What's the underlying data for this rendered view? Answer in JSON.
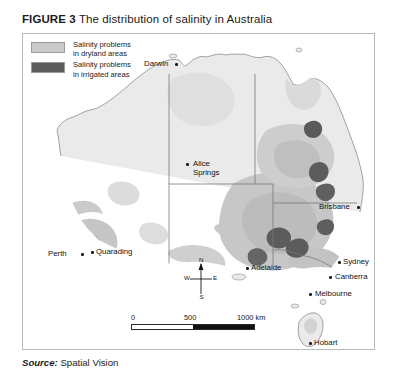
{
  "figure": {
    "label": "FIGURE 3",
    "title": "The distribution of salinity in Australia"
  },
  "legend": {
    "items": [
      {
        "swatch_color": "#c9c9c9",
        "line1": "Salinity problems",
        "line2": "in dryland areas"
      },
      {
        "swatch_color": "#5c5c5c",
        "line1": "Salinity problems",
        "line2": "in irrigated areas"
      }
    ]
  },
  "map": {
    "cities": [
      {
        "name": "Darwin",
        "label_x": 121,
        "label_y": 25,
        "dot_x": 152,
        "dot_y": 29
      },
      {
        "name": "Alice Springs",
        "label_x": 170,
        "label_y": 125,
        "dot_x": 163,
        "dot_y": 129,
        "two_line": true
      },
      {
        "name": "Brisbane",
        "label_x": 296,
        "label_y": 168,
        "dot_x": 334,
        "dot_y": 172
      },
      {
        "name": "Sydney",
        "label_x": 320,
        "label_y": 223,
        "dot_x": 315,
        "dot_y": 227
      },
      {
        "name": "Canberra",
        "label_x": 312,
        "label_y": 238,
        "dot_x": 306,
        "dot_y": 242
      },
      {
        "name": "Melbourne",
        "label_x": 292,
        "label_y": 255,
        "dot_x": 286,
        "dot_y": 259
      },
      {
        "name": "Adelaide",
        "label_x": 228,
        "label_y": 229,
        "dot_x": 223,
        "dot_y": 233
      },
      {
        "name": "Perth",
        "label_x": 25,
        "label_y": 215,
        "dot_x": 58,
        "dot_y": 219
      },
      {
        "name": "Quarading",
        "label_x": 73,
        "label_y": 213,
        "dot_x": 68,
        "dot_y": 217
      },
      {
        "name": "Hobart",
        "label_x": 291,
        "label_y": 304,
        "dot_x": 286,
        "dot_y": 308
      }
    ],
    "compass": {
      "north": "N",
      "south": "S",
      "east": "E",
      "west": "W"
    },
    "scalebar": {
      "tick_0": "0",
      "tick_500": "500",
      "tick_1000": "1000 km"
    },
    "colors": {
      "ocean": "#ffffff",
      "land": "#eaeaea",
      "land_outline": "#8c8c8c",
      "dryland_salinity": "#cdcdcd",
      "dryland_salinity_dark": "#b4b4b4",
      "irrigated_salinity": "#5c5c5c",
      "state_border": "#7a7a7a"
    }
  },
  "source": {
    "label": "Source:",
    "value": "Spatial Vision"
  }
}
